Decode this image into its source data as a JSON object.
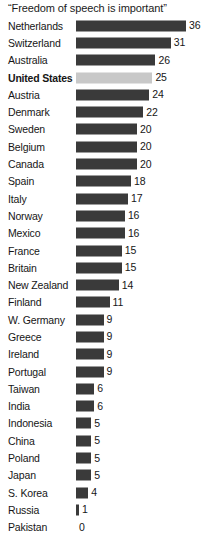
{
  "chart_data": {
    "type": "bar",
    "title": "“Freedom of speech is important”",
    "xlabel": "",
    "ylabel": "",
    "orientation": "horizontal",
    "grid": false,
    "legend": null,
    "xlim": [
      0,
      36
    ],
    "highlight_category": "United States",
    "colors": {
      "bar": "#3a3a3a",
      "bar_highlight": "#c8c8c8",
      "background": "#ffffff",
      "text": "#161616"
    },
    "categories": [
      "Netherlands",
      "Switzerland",
      "Australia",
      "United States",
      "Austria",
      "Denmark",
      "Sweden",
      "Belgium",
      "Canada",
      "Spain",
      "Italy",
      "Norway",
      "Mexico",
      "France",
      "Britain",
      "New Zealand",
      "Finland",
      "W. Germany",
      "Greece",
      "Ireland",
      "Portugal",
      "Taiwan",
      "India",
      "Indonesia",
      "China",
      "Poland",
      "Japan",
      "S. Korea",
      "Russia",
      "Pakistan"
    ],
    "values": [
      36,
      31,
      26,
      25,
      24,
      22,
      20,
      20,
      20,
      18,
      17,
      16,
      16,
      15,
      15,
      14,
      11,
      9,
      9,
      9,
      9,
      6,
      6,
      5,
      5,
      5,
      5,
      4,
      1,
      0
    ],
    "rows": [
      {
        "label": "Netherlands",
        "value": 36,
        "value_text": "36",
        "highlight": false
      },
      {
        "label": "Switzerland",
        "value": 31,
        "value_text": "31",
        "highlight": false
      },
      {
        "label": "Australia",
        "value": 26,
        "value_text": "26",
        "highlight": false
      },
      {
        "label": "United States",
        "value": 25,
        "value_text": "25",
        "highlight": true
      },
      {
        "label": "Austria",
        "value": 24,
        "value_text": "24",
        "highlight": false
      },
      {
        "label": "Denmark",
        "value": 22,
        "value_text": "22",
        "highlight": false
      },
      {
        "label": "Sweden",
        "value": 20,
        "value_text": "20",
        "highlight": false
      },
      {
        "label": "Belgium",
        "value": 20,
        "value_text": "20",
        "highlight": false
      },
      {
        "label": "Canada",
        "value": 20,
        "value_text": "20",
        "highlight": false
      },
      {
        "label": "Spain",
        "value": 18,
        "value_text": "18",
        "highlight": false
      },
      {
        "label": "Italy",
        "value": 17,
        "value_text": "17",
        "highlight": false
      },
      {
        "label": "Norway",
        "value": 16,
        "value_text": "16",
        "highlight": false
      },
      {
        "label": "Mexico",
        "value": 16,
        "value_text": "16",
        "highlight": false
      },
      {
        "label": "France",
        "value": 15,
        "value_text": "15",
        "highlight": false
      },
      {
        "label": "Britain",
        "value": 15,
        "value_text": "15",
        "highlight": false
      },
      {
        "label": "New Zealand",
        "value": 14,
        "value_text": "14",
        "highlight": false
      },
      {
        "label": "Finland",
        "value": 11,
        "value_text": "11",
        "highlight": false
      },
      {
        "label": "W. Germany",
        "value": 9,
        "value_text": "9",
        "highlight": false
      },
      {
        "label": "Greece",
        "value": 9,
        "value_text": "9",
        "highlight": false
      },
      {
        "label": "Ireland",
        "value": 9,
        "value_text": "9",
        "highlight": false
      },
      {
        "label": "Portugal",
        "value": 9,
        "value_text": "9",
        "highlight": false
      },
      {
        "label": "Taiwan",
        "value": 6,
        "value_text": "6",
        "highlight": false
      },
      {
        "label": "India",
        "value": 6,
        "value_text": "6",
        "highlight": false
      },
      {
        "label": "Indonesia",
        "value": 5,
        "value_text": "5",
        "highlight": false
      },
      {
        "label": "China",
        "value": 5,
        "value_text": "5",
        "highlight": false
      },
      {
        "label": "Poland",
        "value": 5,
        "value_text": "5",
        "highlight": false
      },
      {
        "label": "Japan",
        "value": 5,
        "value_text": "5",
        "highlight": false
      },
      {
        "label": "S. Korea",
        "value": 4,
        "value_text": "4",
        "highlight": false
      },
      {
        "label": "Russia",
        "value": 1,
        "value_text": "1",
        "highlight": false
      },
      {
        "label": "Pakistan",
        "value": 0,
        "value_text": "0",
        "highlight": false
      }
    ]
  }
}
